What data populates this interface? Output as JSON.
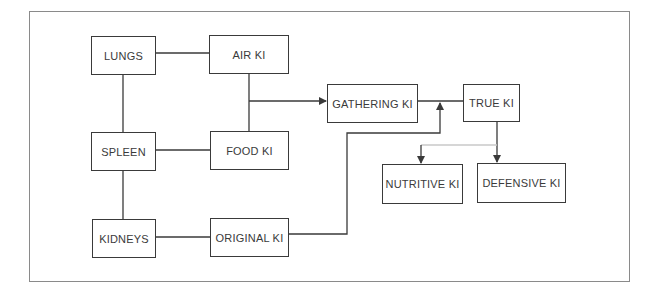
{
  "diagram": {
    "type": "flowchart",
    "nodes": {
      "lungs": {
        "label": "LUNGS"
      },
      "air_ki": {
        "label": "AIR KI"
      },
      "spleen": {
        "label": "SPLEEN"
      },
      "food_ki": {
        "label": "FOOD KI"
      },
      "kidneys": {
        "label": "KIDNEYS"
      },
      "original_ki": {
        "label": "ORIGINAL KI"
      },
      "gathering_ki": {
        "label": "GATHERING KI"
      },
      "true_ki": {
        "label": "TRUE KI"
      },
      "nutritive_ki": {
        "label": "NUTRITIVE KI"
      },
      "defensive_ki": {
        "label": "DEFENSIVE KI"
      }
    },
    "edges": [
      {
        "from": "LUNGS",
        "to": "AIR KI",
        "arrow": false
      },
      {
        "from": "LUNGS",
        "to": "SPLEEN",
        "arrow": false
      },
      {
        "from": "SPLEEN",
        "to": "FOOD KI",
        "arrow": false
      },
      {
        "from": "SPLEEN",
        "to": "KIDNEYS",
        "arrow": false
      },
      {
        "from": "KIDNEYS",
        "to": "ORIGINAL KI",
        "arrow": false
      },
      {
        "from": "AIR KI",
        "to": "FOOD KI",
        "arrow": false
      },
      {
        "from": "AIR KI + FOOD KI",
        "to": "GATHERING KI",
        "arrow": true
      },
      {
        "from": "GATHERING KI",
        "to": "TRUE KI",
        "arrow": false
      },
      {
        "from": "ORIGINAL KI",
        "to": "GATHERING KI-TRUE KI junction",
        "arrow": true
      },
      {
        "from": "TRUE KI",
        "to": "NUTRITIVE KI",
        "arrow": true
      },
      {
        "from": "TRUE KI",
        "to": "DEFENSIVE KI",
        "arrow": true
      }
    ],
    "colors": {
      "line": "#3a3a3a",
      "frame": "#8a8a8a",
      "background": "#ffffff"
    }
  }
}
